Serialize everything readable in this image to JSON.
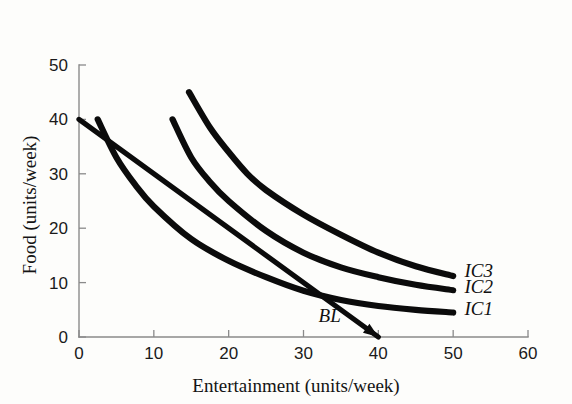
{
  "chart_data": {
    "type": "line",
    "title": "",
    "xlabel": "Entertainment (units/week)",
    "ylabel": "Food (units/week)",
    "xlim": [
      0,
      60
    ],
    "ylim": [
      0,
      50
    ],
    "xticks": [
      0,
      10,
      20,
      30,
      40,
      50,
      60
    ],
    "yticks": [
      0,
      10,
      20,
      30,
      40,
      50
    ],
    "xtick_labels": [
      "0",
      "10",
      "20",
      "30",
      "40",
      "50",
      "60"
    ],
    "ytick_labels": [
      "0",
      "10",
      "20",
      "30",
      "40",
      "50"
    ],
    "grid": false,
    "legend": "inline-right-of-curve-ends",
    "series": [
      {
        "name": "IC1",
        "label": "IC1",
        "kind": "indifference-curve",
        "points": [
          [
            2.5,
            40.0
          ],
          [
            5.0,
            33.0
          ],
          [
            7.5,
            28.0
          ],
          [
            10.0,
            24.0
          ],
          [
            15.0,
            18.0
          ],
          [
            20.0,
            14.0
          ],
          [
            25.0,
            11.0
          ],
          [
            30.0,
            8.5
          ],
          [
            35.0,
            6.8
          ],
          [
            40.0,
            5.7
          ],
          [
            45.0,
            5.0
          ],
          [
            50.0,
            4.5
          ]
        ],
        "label_position": [
          51.5,
          4.0
        ]
      },
      {
        "name": "IC2",
        "label": "IC2",
        "kind": "indifference-curve",
        "points": [
          [
            12.5,
            40.0
          ],
          [
            15.0,
            33.0
          ],
          [
            17.5,
            28.5
          ],
          [
            20.0,
            25.0
          ],
          [
            25.0,
            19.5
          ],
          [
            30.0,
            15.5
          ],
          [
            35.0,
            12.8
          ],
          [
            40.0,
            11.0
          ],
          [
            45.0,
            9.6
          ],
          [
            50.0,
            8.6
          ]
        ],
        "label_position": [
          51.5,
          8.0
        ]
      },
      {
        "name": "IC3",
        "label": "IC3",
        "kind": "indifference-curve",
        "points": [
          [
            14.7,
            45.0
          ],
          [
            17.5,
            38.5
          ],
          [
            20.0,
            34.0
          ],
          [
            22.5,
            30.0
          ],
          [
            25.0,
            27.0
          ],
          [
            30.0,
            22.5
          ],
          [
            35.0,
            18.8
          ],
          [
            40.0,
            15.5
          ],
          [
            45.0,
            13.0
          ],
          [
            50.0,
            11.2
          ]
        ],
        "label_position": [
          51.5,
          11.0
        ]
      },
      {
        "name": "BL",
        "label": "BL",
        "kind": "budget-line",
        "points": [
          [
            0.0,
            40.0
          ],
          [
            40.0,
            0.0
          ]
        ],
        "arrow_end": [
          40.0,
          0.0
        ],
        "label_position": [
          33.5,
          2.8
        ]
      }
    ],
    "annotations": [
      {
        "text": "IC3",
        "x": 51.5,
        "y": 11.0,
        "style": "italic"
      },
      {
        "text": "IC2",
        "x": 51.5,
        "y": 8.0,
        "style": "italic"
      },
      {
        "text": "IC1",
        "x": 51.5,
        "y": 4.0,
        "style": "italic"
      },
      {
        "text": "BL",
        "x": 33.5,
        "y": 2.8,
        "style": "italic"
      }
    ]
  },
  "axes": {
    "x_title": "Entertainment (units/week)",
    "y_title": "Food (units/week)",
    "x_ticks": [
      "0",
      "10",
      "20",
      "30",
      "40",
      "50",
      "60"
    ],
    "y_ticks": [
      "0",
      "10",
      "20",
      "30",
      "40",
      "50"
    ]
  },
  "labels": {
    "ic1": "IC1",
    "ic2": "IC2",
    "ic3": "IC3",
    "bl": "BL"
  },
  "colors": {
    "curve": "#0b0b0b",
    "axis": "#8a8a8a",
    "text": "#141414",
    "background": "#fdfdfb"
  }
}
